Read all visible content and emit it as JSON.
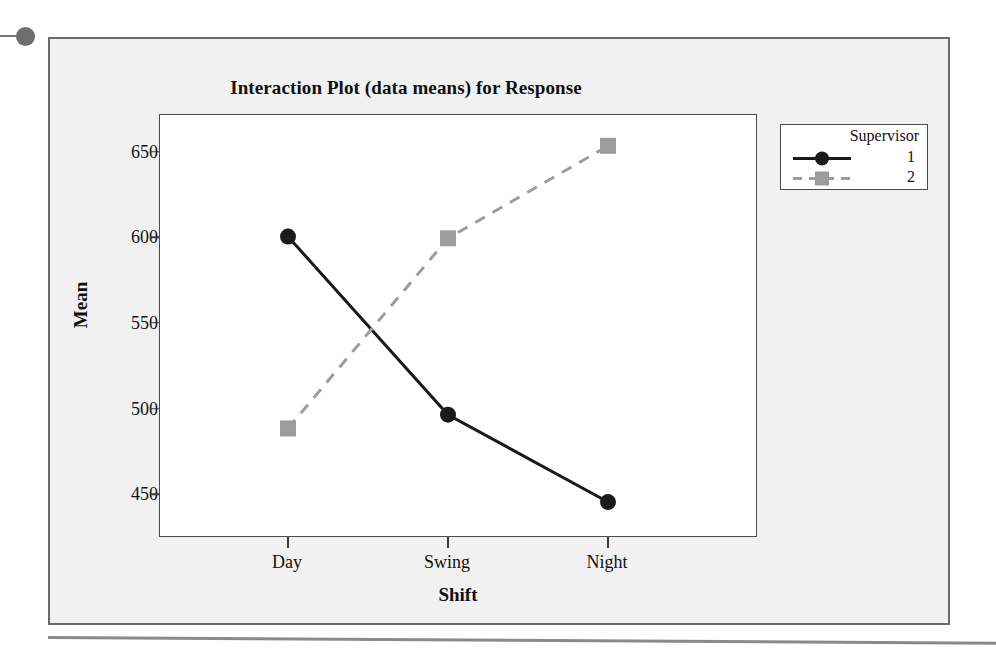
{
  "figure": {
    "title": "Interaction Plot (data means) for Response"
  },
  "chart_data": {
    "type": "line",
    "title": "Interaction Plot (data means) for Response",
    "xlabel": "Shift",
    "ylabel": "Mean",
    "categories": [
      "Day",
      "Swing",
      "Night"
    ],
    "ylim": [
      425,
      672
    ],
    "yticks": [
      450,
      500,
      550,
      600,
      650
    ],
    "ytick_labels": [
      "450",
      "500",
      "550",
      "600",
      "650"
    ],
    "grid": false,
    "legend": {
      "title": "Supervisor",
      "position": "top-right",
      "entries": [
        "1",
        "2"
      ]
    },
    "series": [
      {
        "name": "1",
        "values": [
          601,
          497,
          446
        ],
        "color": "#1a1a1a",
        "line_style": "solid",
        "marker": "circle"
      },
      {
        "name": "2",
        "values": [
          489,
          600,
          654
        ],
        "color": "#9c9c9c",
        "line_style": "dashed",
        "marker": "square"
      }
    ]
  },
  "colors": {
    "series_1": "#1a1a1a",
    "series_2": "#9c9c9c",
    "panel_background": "#ffffff",
    "figure_background": "#f1f1f1",
    "axis": "#4a4a4a"
  }
}
